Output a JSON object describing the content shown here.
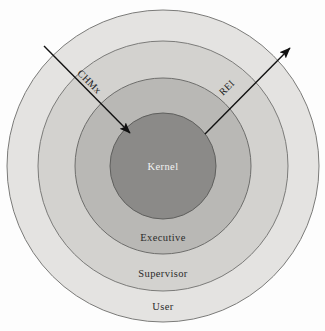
{
  "diagram": {
    "background_color": "#fdfdfd",
    "rings": [
      {
        "id": "user",
        "label": "User",
        "color": "#e4e3e1",
        "stroke": "#7b7b79",
        "radius": 156,
        "label_x": 163,
        "label_y": 310
      },
      {
        "id": "supervisor",
        "label": "Supervisor",
        "color": "#d3d2cf",
        "stroke": "#7b7b79",
        "radius": 125,
        "label_x": 163,
        "label_y": 277
      },
      {
        "id": "executive",
        "label": "Executive",
        "color": "#b9b8b5",
        "stroke": "#6e6e6c",
        "radius": 88,
        "label_x": 163,
        "label_y": 241
      },
      {
        "id": "kernel",
        "label": "Kernel",
        "color": "#8b8a88",
        "stroke": "#5f5f5d",
        "radius": 53,
        "label_x": 163,
        "label_y": 170
      }
    ],
    "center": {
      "x": 163,
      "y": 166
    },
    "arrows": [
      {
        "id": "chmx",
        "label": "CHMx",
        "direction": "inward",
        "color": "#111111",
        "x1": 44,
        "y1": 46,
        "x2": 130,
        "y2": 133,
        "label_x": 87,
        "label_y": 84,
        "label_rotation": 45
      },
      {
        "id": "rei",
        "label": "REI",
        "direction": "outward",
        "color": "#111111",
        "x1": 205,
        "y1": 134,
        "x2": 290,
        "y2": 48,
        "label_x": 229,
        "label_y": 90,
        "label_rotation": -45
      }
    ]
  }
}
